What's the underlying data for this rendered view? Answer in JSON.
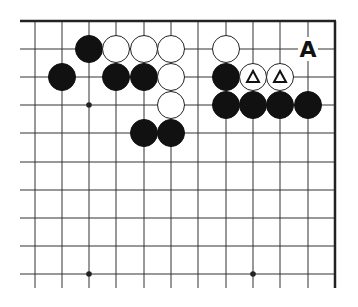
{
  "diagram": {
    "type": "go-board-partial",
    "title": "",
    "label": "A",
    "colors": {
      "black": "#111111",
      "white": "#ffffff",
      "line": "#333333",
      "edge": "#222222"
    },
    "geometry": {
      "columns_x": [
        35,
        62,
        89,
        116,
        144,
        171,
        198,
        226,
        253,
        280,
        308
      ],
      "right_edge_x": 335,
      "rows_y": [
        21,
        49,
        77,
        105,
        133,
        162,
        190,
        218,
        246,
        274
      ],
      "top_edge_y": 21,
      "line_start_x": 20,
      "line_end_y": 288,
      "stone_radius": 13.5
    },
    "star_points": [
      {
        "col": 2,
        "row": 3
      },
      {
        "col": 2,
        "row": 9
      },
      {
        "col": 8,
        "row": 9
      }
    ],
    "stones": [
      {
        "color": "black",
        "col": 2,
        "row": 1
      },
      {
        "color": "white",
        "col": 3,
        "row": 1
      },
      {
        "color": "white",
        "col": 4,
        "row": 1
      },
      {
        "color": "white",
        "col": 5,
        "row": 1
      },
      {
        "color": "white",
        "col": 7,
        "row": 1
      },
      {
        "color": "black",
        "col": 1,
        "row": 2
      },
      {
        "color": "black",
        "col": 3,
        "row": 2
      },
      {
        "color": "black",
        "col": 4,
        "row": 2
      },
      {
        "color": "white",
        "col": 5,
        "row": 2
      },
      {
        "color": "black",
        "col": 7,
        "row": 2
      },
      {
        "color": "white",
        "col": 8,
        "row": 2,
        "mark": "triangle"
      },
      {
        "color": "white",
        "col": 9,
        "row": 2,
        "mark": "triangle"
      },
      {
        "color": "white",
        "col": 5,
        "row": 3
      },
      {
        "color": "black",
        "col": 7,
        "row": 3
      },
      {
        "color": "black",
        "col": 8,
        "row": 3
      },
      {
        "color": "black",
        "col": 9,
        "row": 3
      },
      {
        "color": "black",
        "col": 10,
        "row": 3
      },
      {
        "color": "black",
        "col": 4,
        "row": 4
      },
      {
        "color": "black",
        "col": 5,
        "row": 4
      }
    ],
    "labels": [
      {
        "text": "A",
        "col": 10,
        "row": 1
      }
    ]
  }
}
